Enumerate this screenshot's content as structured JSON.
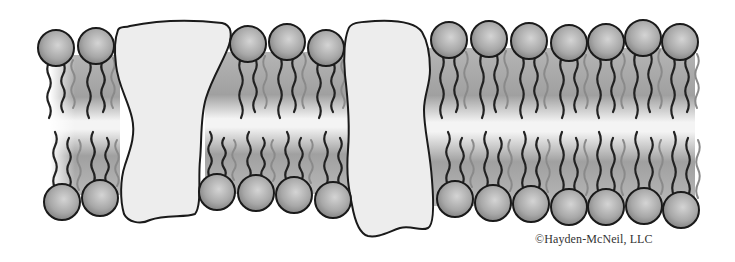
{
  "figure": {
    "credit": "©Hayden-McNeil, LLC"
  },
  "colors": {
    "head_fill_light": "#c8c8c8",
    "head_fill_dark": "#7a7a7a",
    "outline": "#1a1a1a",
    "tail_dark": "#222222",
    "tail_light": "#8a8a8a",
    "protein_fill": "#ececec",
    "core_gradient_edge": "#9a9a9a",
    "core_gradient_mid": "#f2f2f2"
  },
  "top_heads": [
    {
      "cx": 56,
      "cy": 48
    },
    {
      "cx": 96,
      "cy": 46
    },
    {
      "cx": 248,
      "cy": 44
    },
    {
      "cx": 287,
      "cy": 42
    },
    {
      "cx": 326,
      "cy": 48
    },
    {
      "cx": 449,
      "cy": 40
    },
    {
      "cx": 489,
      "cy": 39
    },
    {
      "cx": 529,
      "cy": 41
    },
    {
      "cx": 569,
      "cy": 43
    },
    {
      "cx": 606,
      "cy": 42
    },
    {
      "cx": 643,
      "cy": 38
    },
    {
      "cx": 680,
      "cy": 42
    }
  ],
  "bottom_heads": [
    {
      "cx": 62,
      "cy": 202
    },
    {
      "cx": 100,
      "cy": 198
    },
    {
      "cx": 217,
      "cy": 192
    },
    {
      "cx": 256,
      "cy": 193
    },
    {
      "cx": 294,
      "cy": 195
    },
    {
      "cx": 333,
      "cy": 200
    },
    {
      "cx": 455,
      "cy": 199
    },
    {
      "cx": 493,
      "cy": 203
    },
    {
      "cx": 531,
      "cy": 204
    },
    {
      "cx": 569,
      "cy": 207
    },
    {
      "cx": 606,
      "cy": 207
    },
    {
      "cx": 644,
      "cy": 206
    },
    {
      "cx": 681,
      "cy": 210
    }
  ],
  "head_radius": 18
}
